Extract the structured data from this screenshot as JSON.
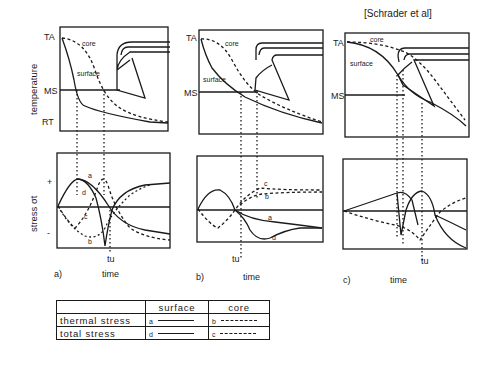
{
  "attribution": "[Schrader et al]",
  "axes": {
    "temperature_ylabel": "temperature",
    "stress_ylabel": "stress σt",
    "xlabel": "time",
    "temp_ticks": [
      "TA",
      "MS",
      "RT"
    ],
    "stress_ticks": [
      "+",
      "-"
    ]
  },
  "panels": [
    {
      "id": "a)",
      "label": "a)",
      "tu_label": "tu",
      "core_label": "core",
      "surface_label": "surface"
    },
    {
      "id": "b)",
      "label": "b)",
      "tu_label": "tu",
      "core_label": "core",
      "surface_label": "surface"
    },
    {
      "id": "c)",
      "label": "c)",
      "tu_label": "tu",
      "core_label": "core",
      "surface_label": "surface"
    }
  ],
  "curve_labels": {
    "a": "a",
    "b": "b",
    "c": "c",
    "d": "d"
  },
  "legend": {
    "headers": [
      "",
      "surface",
      "core"
    ],
    "rows": [
      {
        "label": "thermal stress",
        "surface_tag": "a",
        "surface_style": "solid",
        "core_tag": "b",
        "core_style": "dashed"
      },
      {
        "label": "total stress",
        "surface_tag": "d",
        "surface_style": "solid",
        "core_tag": "c",
        "core_style": "dashed"
      }
    ]
  },
  "colors": {
    "ink": "#1a1a1a",
    "background": "#ffffff"
  }
}
